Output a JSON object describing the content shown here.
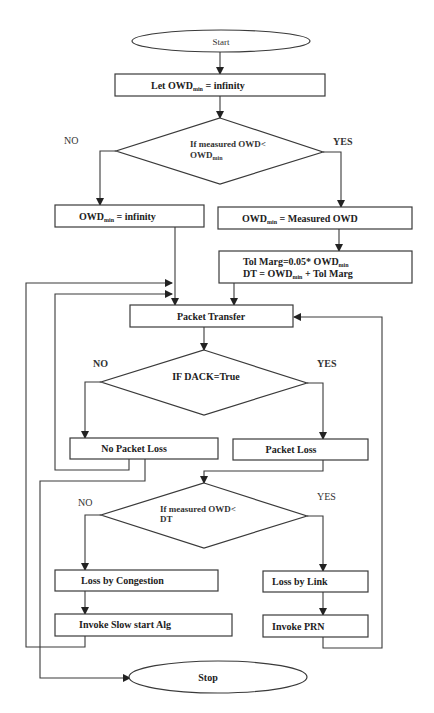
{
  "diagram": {
    "type": "flowchart",
    "nodes": {
      "start": {
        "label": "Start",
        "shape": "oval"
      },
      "init": {
        "label_main": "Let OWD",
        "label_sub": "min",
        "label_tail": " = infinity",
        "shape": "process"
      },
      "decision1": {
        "line1": "If   measured   OWD<",
        "line2_main": "OWD",
        "line2_sub": "min",
        "shape": "decision",
        "no_label": "NO",
        "yes_label": "YES"
      },
      "owd_inf": {
        "label_main": "OWD",
        "label_sub": "min",
        "label_tail": " = infinity",
        "shape": "process"
      },
      "owd_measured": {
        "label_main": "OWD",
        "label_sub": "min",
        "label_tail": " = Measured OWD",
        "shape": "process"
      },
      "tol_marg": {
        "line1_main": "Tol Marg=0.05* OWD",
        "line1_sub": "min",
        "line2_a": "DT = OWD",
        "line2_sub": "min",
        "line2_tail": " + Tol Marg",
        "shape": "process"
      },
      "packet_transfer": {
        "label": "Packet Transfer",
        "shape": "process"
      },
      "decision2": {
        "label": "IF DACK=True",
        "shape": "decision",
        "no_label": "NO",
        "yes_label": "YES"
      },
      "no_packet_loss": {
        "label": "No Packet Loss",
        "shape": "process"
      },
      "packet_loss": {
        "label": "Packet Loss",
        "shape": "process"
      },
      "decision3": {
        "line1": "If    measured    OWD<",
        "line2": "DT",
        "shape": "decision",
        "no_label": "NO",
        "yes_label": "YES"
      },
      "loss_congestion": {
        "label": "Loss by Congestion",
        "shape": "process"
      },
      "loss_link": {
        "label": "Loss by Link",
        "shape": "process"
      },
      "slow_start": {
        "label": "Invoke Slow start Alg",
        "shape": "process"
      },
      "invoke_prn": {
        "label": "Invoke PRN",
        "shape": "process"
      },
      "stop": {
        "label": "Stop",
        "shape": "oval"
      }
    },
    "edges": [
      {
        "from": "start",
        "to": "init"
      },
      {
        "from": "init",
        "to": "decision1"
      },
      {
        "from": "decision1",
        "to": "owd_inf",
        "label": "NO"
      },
      {
        "from": "decision1",
        "to": "owd_measured",
        "label": "YES"
      },
      {
        "from": "owd_measured",
        "to": "tol_marg"
      },
      {
        "from": "owd_inf",
        "to": "packet_transfer"
      },
      {
        "from": "tol_marg",
        "to": "packet_transfer"
      },
      {
        "from": "packet_transfer",
        "to": "decision2"
      },
      {
        "from": "decision2",
        "to": "no_packet_loss",
        "label": "NO"
      },
      {
        "from": "decision2",
        "to": "packet_loss",
        "label": "YES"
      },
      {
        "from": "no_packet_loss",
        "to": "packet_transfer"
      },
      {
        "from": "no_packet_loss",
        "to": "stop"
      },
      {
        "from": "packet_loss",
        "to": "decision3"
      },
      {
        "from": "decision3",
        "to": "loss_congestion",
        "label": "NO"
      },
      {
        "from": "decision3",
        "to": "loss_link",
        "label": "YES"
      },
      {
        "from": "loss_congestion",
        "to": "slow_start"
      },
      {
        "from": "loss_link",
        "to": "invoke_prn"
      },
      {
        "from": "slow_start",
        "to": "packet_transfer"
      },
      {
        "from": "invoke_prn",
        "to": "packet_transfer"
      }
    ]
  }
}
